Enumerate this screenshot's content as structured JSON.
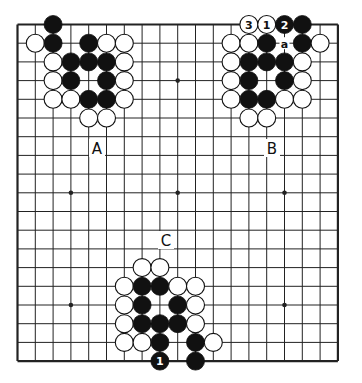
{
  "diagram": {
    "type": "go-board",
    "size": 19,
    "grid": {
      "x0": 17.5,
      "dx": 17.8,
      "y0": 24.5,
      "dy": 18.7
    },
    "stone_radius": 9,
    "star_points": [
      [
        3,
        3
      ],
      [
        9,
        3
      ],
      [
        15,
        3
      ],
      [
        3,
        9
      ],
      [
        9,
        9
      ],
      [
        15,
        9
      ],
      [
        3,
        15
      ],
      [
        9,
        15
      ],
      [
        15,
        15
      ]
    ],
    "colors": {
      "line": "#222222",
      "black": "#111111",
      "white": "#ffffff",
      "background": "#ffffff"
    },
    "stones": [
      {
        "c": "B",
        "x": 2,
        "y": 0
      },
      {
        "c": "W",
        "x": 1,
        "y": 1
      },
      {
        "c": "B",
        "x": 2,
        "y": 1
      },
      {
        "c": "B",
        "x": 4,
        "y": 1
      },
      {
        "c": "W",
        "x": 5,
        "y": 1
      },
      {
        "c": "W",
        "x": 6,
        "y": 1
      },
      {
        "c": "W",
        "x": 2,
        "y": 2
      },
      {
        "c": "B",
        "x": 3,
        "y": 2
      },
      {
        "c": "B",
        "x": 4,
        "y": 2
      },
      {
        "c": "B",
        "x": 5,
        "y": 2
      },
      {
        "c": "W",
        "x": 6,
        "y": 2
      },
      {
        "c": "W",
        "x": 2,
        "y": 3
      },
      {
        "c": "B",
        "x": 3,
        "y": 3
      },
      {
        "c": "B",
        "x": 5,
        "y": 3
      },
      {
        "c": "W",
        "x": 6,
        "y": 3
      },
      {
        "c": "W",
        "x": 2,
        "y": 4
      },
      {
        "c": "W",
        "x": 3,
        "y": 4
      },
      {
        "c": "B",
        "x": 4,
        "y": 4
      },
      {
        "c": "B",
        "x": 5,
        "y": 4
      },
      {
        "c": "W",
        "x": 6,
        "y": 4
      },
      {
        "c": "W",
        "x": 4,
        "y": 5
      },
      {
        "c": "W",
        "x": 5,
        "y": 5
      },
      {
        "c": "W",
        "x": 13,
        "y": 0,
        "label": "3"
      },
      {
        "c": "W",
        "x": 14,
        "y": 0,
        "label": "1"
      },
      {
        "c": "B",
        "x": 15,
        "y": 0,
        "label": "2"
      },
      {
        "c": "B",
        "x": 16,
        "y": 0
      },
      {
        "c": "W",
        "x": 12,
        "y": 1
      },
      {
        "c": "W",
        "x": 13,
        "y": 1
      },
      {
        "c": "B",
        "x": 14,
        "y": 1
      },
      {
        "c": "B",
        "x": 16,
        "y": 1
      },
      {
        "c": "W",
        "x": 17,
        "y": 1
      },
      {
        "c": "W",
        "x": 12,
        "y": 2
      },
      {
        "c": "B",
        "x": 13,
        "y": 2
      },
      {
        "c": "B",
        "x": 14,
        "y": 2
      },
      {
        "c": "B",
        "x": 15,
        "y": 2
      },
      {
        "c": "W",
        "x": 16,
        "y": 2
      },
      {
        "c": "W",
        "x": 12,
        "y": 3
      },
      {
        "c": "B",
        "x": 13,
        "y": 3
      },
      {
        "c": "B",
        "x": 15,
        "y": 3
      },
      {
        "c": "W",
        "x": 16,
        "y": 3
      },
      {
        "c": "W",
        "x": 12,
        "y": 4
      },
      {
        "c": "B",
        "x": 13,
        "y": 4
      },
      {
        "c": "B",
        "x": 14,
        "y": 4
      },
      {
        "c": "W",
        "x": 15,
        "y": 4
      },
      {
        "c": "W",
        "x": 16,
        "y": 4
      },
      {
        "c": "W",
        "x": 13,
        "y": 5
      },
      {
        "c": "W",
        "x": 14,
        "y": 5
      },
      {
        "c": "W",
        "x": 7,
        "y": 13
      },
      {
        "c": "W",
        "x": 8,
        "y": 13
      },
      {
        "c": "W",
        "x": 6,
        "y": 14
      },
      {
        "c": "B",
        "x": 7,
        "y": 14
      },
      {
        "c": "B",
        "x": 8,
        "y": 14
      },
      {
        "c": "W",
        "x": 9,
        "y": 14
      },
      {
        "c": "W",
        "x": 10,
        "y": 14
      },
      {
        "c": "W",
        "x": 6,
        "y": 15
      },
      {
        "c": "B",
        "x": 7,
        "y": 15
      },
      {
        "c": "B",
        "x": 9,
        "y": 15
      },
      {
        "c": "W",
        "x": 10,
        "y": 15
      },
      {
        "c": "W",
        "x": 6,
        "y": 16
      },
      {
        "c": "B",
        "x": 7,
        "y": 16
      },
      {
        "c": "B",
        "x": 8,
        "y": 16
      },
      {
        "c": "B",
        "x": 9,
        "y": 16
      },
      {
        "c": "W",
        "x": 10,
        "y": 16
      },
      {
        "c": "W",
        "x": 6,
        "y": 17
      },
      {
        "c": "W",
        "x": 7,
        "y": 17
      },
      {
        "c": "B",
        "x": 8,
        "y": 17
      },
      {
        "c": "B",
        "x": 10,
        "y": 17
      },
      {
        "c": "W",
        "x": 11,
        "y": 17
      },
      {
        "c": "B",
        "x": 8,
        "y": 18,
        "label": "1"
      },
      {
        "c": "B",
        "x": 10,
        "y": 18
      }
    ],
    "point_markers": [
      {
        "x": 15,
        "y": 1,
        "label": "a"
      }
    ],
    "region_labels": [
      {
        "label": "A",
        "px": 97,
        "py": 148
      },
      {
        "label": "B",
        "px": 272,
        "py": 148
      },
      {
        "label": "C",
        "px": 166,
        "py": 240
      }
    ]
  }
}
